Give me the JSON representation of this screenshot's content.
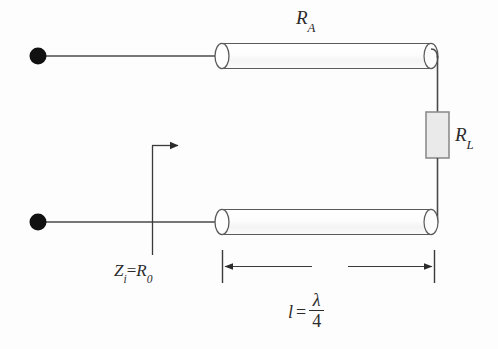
{
  "figure": {
    "type": "circuit-schematic",
    "background_color": "#fdfdfd",
    "line_color": "#4a4a4a",
    "text_color": "#2b2b2b"
  },
  "labels": {
    "line_resistance": {
      "symbol": "R",
      "subscript": "A",
      "text": "RA"
    },
    "load_resistance": {
      "symbol": "R",
      "subscript": "L",
      "text": "RL"
    },
    "input_impedance": {
      "symbol_1": "Z",
      "subscript_1": "i",
      "equals": "=",
      "symbol_2": "R",
      "subscript_2": "0",
      "text": "Zi=R0"
    },
    "length": {
      "variable": "l",
      "equals": "=",
      "numerator": "λ",
      "denominator": "4",
      "text": "l = λ/4"
    }
  },
  "components": {
    "terminal_top": {
      "name": "input-terminal-top",
      "shape": "filled-circle",
      "color": "#111111"
    },
    "terminal_bottom": {
      "name": "input-terminal-bottom",
      "shape": "filled-circle",
      "color": "#111111"
    },
    "conductor_top": {
      "name": "transmission-line-top",
      "shape": "cylinder",
      "fill": "#fbfbfb",
      "stroke": "#555555"
    },
    "conductor_bottom": {
      "name": "transmission-line-bottom",
      "shape": "cylinder",
      "fill": "#fbfbfb",
      "stroke": "#555555"
    },
    "load_resistor": {
      "name": "load-resistor",
      "shape": "rectangle",
      "fill": "#e9e9e9",
      "stroke": "#8a8a8a"
    },
    "impedance_arrow": {
      "name": "input-impedance-arrow",
      "direction": "right"
    },
    "dimension_line": {
      "name": "length-dimension-line",
      "style": "double-arrow-with-end-ticks"
    }
  }
}
